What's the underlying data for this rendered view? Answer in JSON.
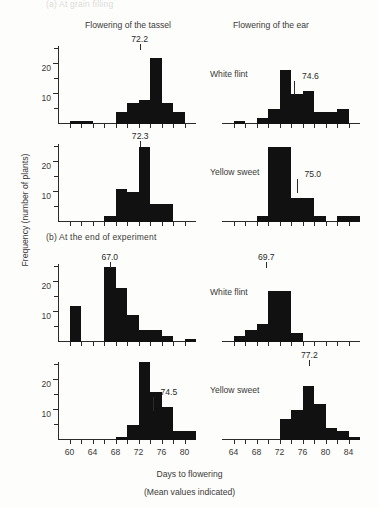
{
  "figure": {
    "section_a_label": "(a)  At grain filling",
    "section_b_label": "(b)  At the end of experiment",
    "column_headers": {
      "tassel": "Flowering of the tassel",
      "ear": "Flowering of the ear"
    },
    "y_axis_title": "Frequency (number of plants)",
    "x_axis_title": "Days to flowering",
    "x_axis_subtitle": "(Mean values indicated)",
    "series_names": {
      "white_flint": "White flint",
      "yellow_sweet": "Yellow sweet"
    },
    "colors": {
      "bar": "#111111",
      "axis": "#2b2b2b",
      "text": "#3a3a3a",
      "faded": "#dcdcda"
    }
  },
  "chart_data": [
    {
      "id": "a-white-flint-tassel",
      "type": "bar",
      "title": "(a) At grain filling — White flint — Flowering of the tassel",
      "xlabel": "Days to flowering",
      "ylabel": "Frequency (number of plants)",
      "xlim": [
        58,
        82
      ],
      "ylim": [
        0,
        26
      ],
      "yticks": [
        10,
        20
      ],
      "yticks_minor": [
        5,
        15,
        25
      ],
      "xticks": [
        60,
        64,
        68,
        72,
        76,
        80
      ],
      "xticks_minor": [
        62,
        66,
        70,
        74,
        78
      ],
      "bin_width": 2,
      "bin_starts": [
        58,
        60,
        62,
        64,
        66,
        68,
        70,
        72,
        74,
        76,
        78,
        80
      ],
      "values": [
        0,
        1,
        1,
        0,
        0,
        4,
        7,
        8,
        22,
        7,
        4,
        0
      ],
      "mean": 72.2,
      "mean_label": "72.2",
      "mean_label_position": "above",
      "legend": "White flint",
      "grid": false
    },
    {
      "id": "a-white-flint-ear",
      "type": "bar",
      "title": "(a) At grain filling — White flint — Flowering of the ear",
      "xlabel": "Days to flowering",
      "ylabel": "Frequency (number of plants)",
      "xlim": [
        62,
        86
      ],
      "ylim": [
        0,
        26
      ],
      "yticks": [
        10,
        20
      ],
      "yticks_minor": [
        5,
        15,
        25
      ],
      "xticks": [
        64,
        68,
        72,
        76,
        80,
        84
      ],
      "xticks_minor": [
        66,
        70,
        74,
        78,
        82
      ],
      "bin_width": 2,
      "bin_starts": [
        62,
        64,
        66,
        68,
        70,
        72,
        74,
        76,
        78,
        80,
        82,
        84
      ],
      "values": [
        0,
        1,
        0,
        2,
        5,
        18,
        10,
        11,
        4,
        4,
        5,
        0
      ],
      "mean": 74.6,
      "mean_label": "74.6",
      "mean_label_position": "inside",
      "legend": "White flint",
      "grid": false
    },
    {
      "id": "a-yellow-sweet-tassel",
      "type": "bar",
      "title": "(a) At grain filling — Yellow sweet — Flowering of the tassel",
      "xlabel": "Days to flowering",
      "ylabel": "Frequency (number of plants)",
      "xlim": [
        58,
        82
      ],
      "ylim": [
        0,
        26
      ],
      "yticks": [
        10,
        20
      ],
      "yticks_minor": [
        5,
        15,
        25
      ],
      "xticks": [
        60,
        64,
        68,
        72,
        76,
        80
      ],
      "xticks_minor": [
        62,
        66,
        70,
        74,
        78
      ],
      "bin_width": 2,
      "bin_starts": [
        58,
        60,
        62,
        64,
        66,
        68,
        70,
        72,
        74,
        76,
        78,
        80
      ],
      "values": [
        0,
        0,
        0,
        0,
        2,
        11,
        10,
        25,
        6,
        6,
        0,
        0
      ],
      "mean": 72.3,
      "mean_label": "72.3",
      "mean_label_position": "above-outside",
      "legend": "Yellow sweet",
      "grid": false
    },
    {
      "id": "a-yellow-sweet-ear",
      "type": "bar",
      "title": "(a) At grain filling — Yellow sweet — Flowering of the ear",
      "xlabel": "Days to flowering",
      "ylabel": "Frequency (number of plants)",
      "xlim": [
        62,
        86
      ],
      "ylim": [
        0,
        26
      ],
      "yticks": [
        10,
        20
      ],
      "yticks_minor": [
        5,
        15,
        25
      ],
      "xticks": [
        64,
        68,
        72,
        76,
        80,
        84
      ],
      "xticks_minor": [
        66,
        70,
        74,
        78,
        82
      ],
      "bin_width": 2,
      "bin_starts": [
        62,
        64,
        66,
        68,
        70,
        72,
        74,
        76,
        78,
        80,
        82,
        84
      ],
      "values": [
        0,
        0,
        0,
        2,
        25,
        25,
        8,
        8,
        2,
        0,
        2,
        2
      ],
      "mean": 75.0,
      "mean_label": "75.0",
      "mean_label_position": "inside",
      "legend": "Yellow sweet",
      "grid": false
    },
    {
      "id": "b-white-flint-tassel",
      "type": "bar",
      "title": "(b) At the end of experiment — White flint — Flowering of the tassel",
      "xlabel": "Days to flowering",
      "ylabel": "Frequency (number of plants)",
      "xlim": [
        58,
        82
      ],
      "ylim": [
        0,
        26
      ],
      "yticks": [
        10,
        20
      ],
      "yticks_minor": [
        5,
        15,
        25
      ],
      "xticks": [
        60,
        64,
        68,
        72,
        76,
        80
      ],
      "xticks_minor": [
        62,
        66,
        70,
        74,
        78
      ],
      "bin_width": 2,
      "bin_starts": [
        58,
        60,
        62,
        64,
        66,
        68,
        70,
        72,
        74,
        76,
        78,
        80
      ],
      "values": [
        0,
        12,
        0,
        0,
        25,
        18,
        9,
        4,
        4,
        2,
        0,
        1
      ],
      "mean": 67.0,
      "mean_label": "67.0",
      "mean_label_position": "above",
      "legend": "White flint",
      "grid": false
    },
    {
      "id": "b-white-flint-ear",
      "type": "bar",
      "title": "(b) At the end of experiment — White flint — Flowering of the ear",
      "xlabel": "Days to flowering",
      "ylabel": "Frequency (number of plants)",
      "xlim": [
        62,
        86
      ],
      "ylim": [
        0,
        26
      ],
      "yticks": [
        10,
        20
      ],
      "yticks_minor": [
        5,
        15,
        25
      ],
      "xticks": [
        64,
        68,
        72,
        76,
        80,
        84
      ],
      "xticks_minor": [
        66,
        70,
        74,
        78,
        82
      ],
      "bin_width": 2,
      "bin_starts": [
        62,
        64,
        66,
        68,
        70,
        72,
        74,
        76,
        78,
        80,
        82,
        84
      ],
      "values": [
        0,
        2,
        4,
        6,
        17,
        17,
        3,
        0,
        0,
        0,
        0,
        0
      ],
      "mean": 69.7,
      "mean_label": "69.7",
      "mean_label_position": "above",
      "legend": "White flint",
      "grid": false
    },
    {
      "id": "b-yellow-sweet-tassel",
      "type": "bar",
      "title": "(b) At the end of experiment — Yellow sweet — Flowering of the tassel",
      "xlabel": "Days to flowering",
      "ylabel": "Frequency (number of plants)",
      "xlim": [
        58,
        82
      ],
      "ylim": [
        0,
        26
      ],
      "yticks": [
        10,
        20
      ],
      "yticks_minor": [
        5,
        15,
        25
      ],
      "xticks": [
        60,
        64,
        68,
        72,
        76,
        80
      ],
      "xticks_minor": [
        62,
        66,
        70,
        74,
        78
      ],
      "bin_width": 2,
      "bin_starts": [
        58,
        60,
        62,
        64,
        66,
        68,
        70,
        72,
        74,
        76,
        78,
        80
      ],
      "values": [
        0,
        0,
        0,
        0,
        0,
        1,
        5,
        26,
        16,
        11,
        3,
        3
      ],
      "mean": 74.5,
      "mean_label": "74.5",
      "mean_label_position": "inside",
      "legend": "Yellow sweet",
      "grid": false
    },
    {
      "id": "b-yellow-sweet-ear",
      "type": "bar",
      "title": "(b) At the end of experiment — Yellow sweet — Flowering of the ear",
      "xlabel": "Days to flowering",
      "ylabel": "Frequency (number of plants)",
      "xlim": [
        62,
        86
      ],
      "ylim": [
        0,
        26
      ],
      "yticks": [
        10,
        20
      ],
      "yticks_minor": [
        5,
        15,
        25
      ],
      "xticks": [
        64,
        68,
        72,
        76,
        80,
        84
      ],
      "xticks_minor": [
        66,
        70,
        74,
        78,
        82
      ],
      "bin_width": 2,
      "bin_starts": [
        62,
        64,
        66,
        68,
        70,
        72,
        74,
        76,
        78,
        80,
        82,
        84
      ],
      "values": [
        0,
        0,
        0,
        0,
        0,
        7,
        10,
        18,
        12,
        4,
        3,
        1
      ],
      "mean": 77.2,
      "mean_label": "77.2",
      "mean_label_position": "above",
      "legend": "Yellow sweet",
      "grid": false
    }
  ]
}
